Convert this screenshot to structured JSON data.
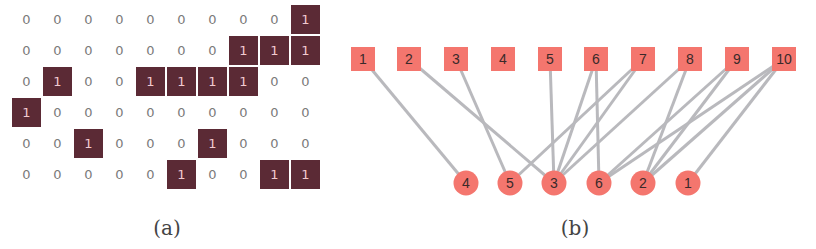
{
  "panel_a": {
    "caption": "(a)",
    "matrix": [
      [
        0,
        0,
        0,
        0,
        0,
        0,
        0,
        0,
        0,
        1
      ],
      [
        0,
        0,
        0,
        0,
        0,
        0,
        0,
        1,
        1,
        1
      ],
      [
        0,
        1,
        0,
        0,
        1,
        1,
        1,
        1,
        0,
        0
      ],
      [
        1,
        0,
        0,
        0,
        0,
        0,
        0,
        0,
        0,
        0
      ],
      [
        0,
        0,
        1,
        0,
        0,
        0,
        1,
        0,
        0,
        0
      ],
      [
        0,
        0,
        0,
        0,
        0,
        1,
        0,
        0,
        1,
        1
      ]
    ]
  },
  "panel_b": {
    "caption": "(b)",
    "square_nodes": [
      {
        "label": "1",
        "x": 363
      },
      {
        "label": "2",
        "x": 409
      },
      {
        "label": "3",
        "x": 456
      },
      {
        "label": "4",
        "x": 503
      },
      {
        "label": "5",
        "x": 550
      },
      {
        "label": "6",
        "x": 596
      },
      {
        "label": "7",
        "x": 643
      },
      {
        "label": "8",
        "x": 690
      },
      {
        "label": "9",
        "x": 737
      },
      {
        "label": "10",
        "x": 784
      }
    ],
    "circle_nodes": [
      {
        "label": "4",
        "x": 466
      },
      {
        "label": "5",
        "x": 510
      },
      {
        "label": "3",
        "x": 554
      },
      {
        "label": "6",
        "x": 599
      },
      {
        "label": "2",
        "x": 643
      },
      {
        "label": "1",
        "x": 688
      }
    ],
    "edges": [
      [
        "1",
        "10"
      ],
      [
        "2",
        "8"
      ],
      [
        "2",
        "9"
      ],
      [
        "2",
        "10"
      ],
      [
        "3",
        "2"
      ],
      [
        "3",
        "5"
      ],
      [
        "3",
        "6"
      ],
      [
        "3",
        "7"
      ],
      [
        "3",
        "8"
      ],
      [
        "4",
        "1"
      ],
      [
        "5",
        "3"
      ],
      [
        "5",
        "7"
      ],
      [
        "6",
        "6"
      ],
      [
        "6",
        "9"
      ],
      [
        "6",
        "10"
      ]
    ],
    "colors": {
      "node_fill": "#f4766e",
      "edge": "#b9b9bd"
    }
  }
}
